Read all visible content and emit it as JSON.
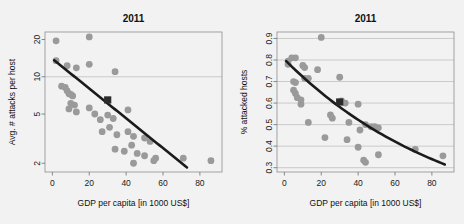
{
  "figure": {
    "width": 464,
    "height": 224,
    "background": "#f2f2f2",
    "point_color": "#9a9a9a",
    "trend_color": "#1b1b1b",
    "highlight_color": "#2b2b2b",
    "grid_color": "#b9b9b9"
  },
  "chart_data": [
    {
      "type": "scatter",
      "panel": "left",
      "title": "2011",
      "xlabel": "GDP per capita [in 1000 US$]",
      "ylabel": "Avg. # attacks per host",
      "xlim": [
        -4,
        92
      ],
      "ylim": [
        1.7,
        23
      ],
      "yscale": "log",
      "xscale": "linear",
      "xticks": [
        0,
        20,
        40,
        60,
        80
      ],
      "yticks": [
        2,
        5,
        10,
        20
      ],
      "grid": "y-gridline at 10 only",
      "legend": "none",
      "points": [
        {
          "x": 2,
          "y": 19.5
        },
        {
          "x": 20,
          "y": 21.0
        },
        {
          "x": 2,
          "y": 13.5
        },
        {
          "x": 8,
          "y": 12.3
        },
        {
          "x": 13,
          "y": 11.8
        },
        {
          "x": 20,
          "y": 12.6
        },
        {
          "x": 34,
          "y": 11.0
        },
        {
          "x": 5,
          "y": 8.4
        },
        {
          "x": 7,
          "y": 8.2
        },
        {
          "x": 8,
          "y": 7.7
        },
        {
          "x": 9,
          "y": 7.3
        },
        {
          "x": 10,
          "y": 7.2
        },
        {
          "x": 11,
          "y": 7.0
        },
        {
          "x": 10,
          "y": 6.1
        },
        {
          "x": 12,
          "y": 5.9
        },
        {
          "x": 9,
          "y": 5.5
        },
        {
          "x": 13,
          "y": 5.2
        },
        {
          "x": 20,
          "y": 5.6
        },
        {
          "x": 23,
          "y": 5.0
        },
        {
          "x": 26,
          "y": 4.5
        },
        {
          "x": 30,
          "y": 4.9
        },
        {
          "x": 33,
          "y": 4.6
        },
        {
          "x": 41,
          "y": 5.4
        },
        {
          "x": 27,
          "y": 3.6
        },
        {
          "x": 31,
          "y": 3.9
        },
        {
          "x": 35,
          "y": 3.4
        },
        {
          "x": 41,
          "y": 3.6
        },
        {
          "x": 44,
          "y": 3.3
        },
        {
          "x": 50,
          "y": 3.2
        },
        {
          "x": 53,
          "y": 3.0
        },
        {
          "x": 34,
          "y": 2.6
        },
        {
          "x": 39,
          "y": 2.5
        },
        {
          "x": 43,
          "y": 2.8
        },
        {
          "x": 46,
          "y": 2.4
        },
        {
          "x": 50,
          "y": 2.3
        },
        {
          "x": 56,
          "y": 2.2
        },
        {
          "x": 44,
          "y": 2.0
        },
        {
          "x": 55,
          "y": 2.1
        },
        {
          "x": 71,
          "y": 2.2
        },
        {
          "x": 86,
          "y": 2.1
        }
      ],
      "highlight_point": {
        "x": 30,
        "y": 6.5
      },
      "trend": {
        "description": "log-linear decreasing fit",
        "x_start": 1,
        "x_end": 73,
        "y_start": 13.6,
        "y_end": 1.85
      }
    },
    {
      "type": "scatter",
      "panel": "right",
      "title": "2011",
      "xlabel": "GDP per capita [in 1000 US$]",
      "ylabel": "% attacked hosts",
      "xlim": [
        -4,
        92
      ],
      "ylim": [
        0.28,
        0.93
      ],
      "yscale": "linear",
      "xscale": "linear",
      "xticks": [
        0,
        20,
        40,
        60,
        80
      ],
      "yticks": [
        0.3,
        0.4,
        0.5,
        0.6,
        0.7,
        0.8,
        0.9
      ],
      "grid": "horizontal gridlines at every y tick",
      "legend": "none",
      "points": [
        {
          "x": 20,
          "y": 0.905
        },
        {
          "x": 2,
          "y": 0.795
        },
        {
          "x": 4,
          "y": 0.81
        },
        {
          "x": 6,
          "y": 0.81
        },
        {
          "x": 2,
          "y": 0.78
        },
        {
          "x": 10,
          "y": 0.775
        },
        {
          "x": 11,
          "y": 0.765
        },
        {
          "x": 18,
          "y": 0.755
        },
        {
          "x": 5,
          "y": 0.7
        },
        {
          "x": 6,
          "y": 0.695
        },
        {
          "x": 11,
          "y": 0.715
        },
        {
          "x": 13,
          "y": 0.715
        },
        {
          "x": 30,
          "y": 0.72
        },
        {
          "x": 5,
          "y": 0.66
        },
        {
          "x": 6,
          "y": 0.645
        },
        {
          "x": 7,
          "y": 0.625
        },
        {
          "x": 9,
          "y": 0.615
        },
        {
          "x": 31,
          "y": 0.61
        },
        {
          "x": 33,
          "y": 0.6
        },
        {
          "x": 9,
          "y": 0.595
        },
        {
          "x": 40,
          "y": 0.595
        },
        {
          "x": 25,
          "y": 0.545
        },
        {
          "x": 26,
          "y": 0.53
        },
        {
          "x": 13,
          "y": 0.51
        },
        {
          "x": 35,
          "y": 0.51
        },
        {
          "x": 44,
          "y": 0.5
        },
        {
          "x": 47,
          "y": 0.49
        },
        {
          "x": 49,
          "y": 0.49
        },
        {
          "x": 51,
          "y": 0.485
        },
        {
          "x": 41,
          "y": 0.475
        },
        {
          "x": 22,
          "y": 0.44
        },
        {
          "x": 34,
          "y": 0.43
        },
        {
          "x": 40,
          "y": 0.395
        },
        {
          "x": 51,
          "y": 0.36
        },
        {
          "x": 71,
          "y": 0.385
        },
        {
          "x": 86,
          "y": 0.355
        },
        {
          "x": 43,
          "y": 0.335
        },
        {
          "x": 44,
          "y": 0.325
        }
      ],
      "highlight_point": {
        "x": 30,
        "y": 0.605
      },
      "trend": {
        "description": "decreasing curve, convex",
        "x_start": 1,
        "x_end": 87,
        "y_start": 0.795,
        "y_end": 0.315
      }
    }
  ]
}
